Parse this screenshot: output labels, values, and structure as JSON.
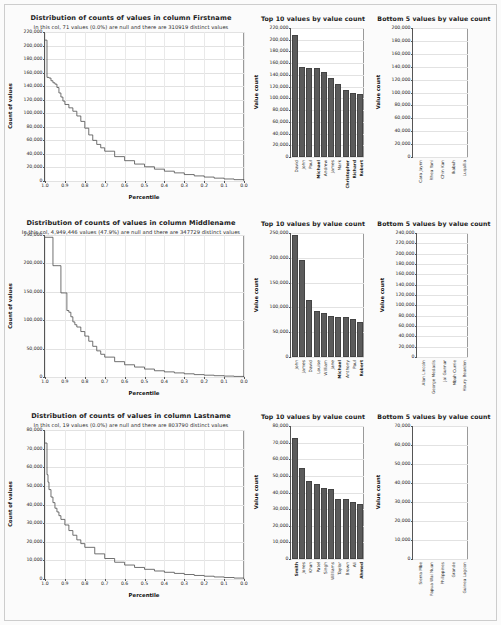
{
  "page": {
    "background_color": "#fbfbfb",
    "bar_color": "#5b5b5b",
    "curve_color": "#4d4d4d"
  },
  "chart_data": [
    {
      "id": "firstname-histogram",
      "type": "line",
      "title": "Distribution of counts of values in column Firstname",
      "subtitle": "In this col, 71 values (0.0%) are null and there are 310919 distinct values",
      "xlabel": "Percentile",
      "ylabel": "Count of values",
      "xlim": [
        1.0,
        0.0
      ],
      "ylim": [
        0,
        220000
      ],
      "xticks": [
        "1.0",
        "0.9",
        "0.8",
        "0.7",
        "0.6",
        "0.5",
        "0.4",
        "0.3",
        "0.2",
        "0.1",
        "0.0"
      ],
      "yticks": [
        "0",
        "20,000",
        "40,000",
        "60,000",
        "80,000",
        "100,000",
        "120,000",
        "140,000",
        "160,000",
        "180,000",
        "200,000",
        "220,000"
      ],
      "grid": true,
      "x": [
        1.0,
        0.995,
        0.99,
        0.98,
        0.97,
        0.96,
        0.95,
        0.94,
        0.93,
        0.92,
        0.91,
        0.9,
        0.88,
        0.86,
        0.84,
        0.82,
        0.8,
        0.78,
        0.76,
        0.74,
        0.72,
        0.7,
        0.65,
        0.6,
        0.55,
        0.5,
        0.45,
        0.4,
        0.35,
        0.3,
        0.25,
        0.2,
        0.15,
        0.1,
        0.05,
        0.0
      ],
      "y": [
        208000,
        208000,
        153000,
        152000,
        148000,
        145000,
        143000,
        138000,
        130000,
        124000,
        118000,
        113000,
        108000,
        103000,
        96000,
        88000,
        78000,
        68000,
        60000,
        54000,
        49000,
        44000,
        36000,
        30000,
        25000,
        21000,
        17500,
        14500,
        12000,
        9500,
        7500,
        5800,
        4200,
        3000,
        2000,
        1200
      ]
    },
    {
      "id": "firstname-top10",
      "type": "bar",
      "title": "Top 10 values by value count",
      "ylabel": "Value count",
      "xlabel": "",
      "ylim": [
        0,
        220000
      ],
      "yticks": [
        "0",
        "20,000",
        "40,000",
        "60,000",
        "80,000",
        "100,000",
        "120,000",
        "140,000",
        "160,000",
        "180,000",
        "200,000",
        "220,000"
      ],
      "categories": [
        "David",
        "John",
        "Paul",
        "Michael",
        "Andrew",
        "James",
        "Mark",
        "Christopher",
        "Richard",
        "Robert"
      ],
      "bold_categories": [
        "Michael",
        "Christopher",
        "Richard",
        "Robert"
      ],
      "values": [
        208000,
        153000,
        152000,
        151000,
        145000,
        134000,
        124000,
        114000,
        110000,
        107000
      ]
    },
    {
      "id": "firstname-bottom5",
      "type": "bar",
      "title": "Bottom 5 values by value count",
      "ylabel": "Value count",
      "xlabel": "",
      "ylim": [
        0,
        200000
      ],
      "yticks": [
        "0",
        "20,000",
        "40,000",
        "60,000",
        "80,000",
        "100,000",
        "120,000",
        "140,000",
        "160,000",
        "180,000",
        "200,000"
      ],
      "categories": [
        "Cara Jaynn",
        "Rhea Yani",
        "Chin Kan",
        "Ikabuh",
        "Luqallia"
      ],
      "values": [
        1,
        1,
        1,
        1,
        1
      ]
    },
    {
      "id": "middlename-histogram",
      "type": "line",
      "title": "Distribution of counts of values in column Middlename",
      "subtitle": "In this col, 4,949,446 values (47.9%) are null and there are 347729 distinct values",
      "xlabel": "Percentile",
      "ylabel": "Count of values",
      "xlim": [
        1.0,
        0.0
      ],
      "ylim": [
        0,
        250000
      ],
      "xticks": [
        "1.0",
        "0.9",
        "0.8",
        "0.7",
        "0.6",
        "0.5",
        "0.4",
        "0.3",
        "0.2",
        "0.1",
        "0.0"
      ],
      "yticks": [
        "0",
        "50,000",
        "100,000",
        "150,000",
        "200,000",
        "250,000"
      ],
      "grid": true,
      "x": [
        1.0,
        0.97,
        0.96,
        0.93,
        0.92,
        0.9,
        0.89,
        0.88,
        0.87,
        0.86,
        0.85,
        0.84,
        0.82,
        0.8,
        0.78,
        0.76,
        0.74,
        0.72,
        0.7,
        0.65,
        0.6,
        0.55,
        0.5,
        0.45,
        0.4,
        0.35,
        0.3,
        0.25,
        0.2,
        0.15,
        0.1,
        0.05,
        0.0
      ],
      "y": [
        246000,
        246000,
        196000,
        196000,
        148000,
        148000,
        117000,
        114000,
        106000,
        97000,
        92000,
        88000,
        80000,
        72000,
        63000,
        54000,
        46000,
        40000,
        35000,
        27000,
        21500,
        17500,
        14000,
        11000,
        9000,
        7200,
        5600,
        4200,
        3200,
        2300,
        1600,
        1000,
        600
      ]
    },
    {
      "id": "middlename-top10",
      "type": "bar",
      "title": "Top 10 values by value count",
      "ylabel": "Value count",
      "xlabel": "",
      "ylim": [
        0,
        250000
      ],
      "yticks": [
        "0",
        "50,000",
        "100,000",
        "150,000",
        "200,000",
        "250,000"
      ],
      "categories": [
        "John",
        "James",
        "David",
        "Louise",
        "William",
        "Jane",
        "Michael",
        "Anthony",
        "Paul",
        "Robert"
      ],
      "bold_categories": [
        "Michael",
        "Robert"
      ],
      "values": [
        246000,
        196000,
        114000,
        93000,
        88000,
        82000,
        81000,
        80000,
        76000,
        70000
      ]
    },
    {
      "id": "middlename-bottom5",
      "type": "bar",
      "title": "Bottom 5 values by value count",
      "ylabel": "Value count",
      "xlabel": "",
      "ylim": [
        0,
        240000
      ],
      "yticks": [
        "0",
        "20,000",
        "40,000",
        "60,000",
        "80,000",
        "100,000",
        "120,000",
        "140,000",
        "160,000",
        "180,000",
        "200,000",
        "220,000",
        "240,000"
      ],
      "categories": [
        "Alan Lincoln",
        "George Medadis",
        "Jai Gunnar",
        "Mbah Currie",
        "Houry Bearden"
      ],
      "bold_categories": [
        "Mbah Currie",
        "Houry Bearden"
      ],
      "values": [
        1,
        1,
        1,
        1,
        1
      ]
    },
    {
      "id": "lastname-histogram",
      "type": "line",
      "title": "Distribution of counts of values in column Lastname",
      "subtitle": "In this col, 19 values (0.0%) are null and there are 803790 distinct values",
      "xlabel": "Percentile",
      "ylabel": "Count of values",
      "xlim": [
        1.0,
        0.0
      ],
      "ylim": [
        0,
        80000
      ],
      "xticks": [
        "1.0",
        "0.9",
        "0.8",
        "0.7",
        "0.6",
        "0.5",
        "0.4",
        "0.3",
        "0.2",
        "0.1",
        "0.0"
      ],
      "yticks": [
        "0",
        "10,000",
        "20,000",
        "30,000",
        "40,000",
        "50,000",
        "60,000",
        "70,000",
        "80,000"
      ],
      "grid": true,
      "x": [
        1.0,
        0.995,
        0.99,
        0.985,
        0.98,
        0.97,
        0.96,
        0.95,
        0.94,
        0.93,
        0.92,
        0.9,
        0.88,
        0.86,
        0.84,
        0.82,
        0.8,
        0.75,
        0.7,
        0.65,
        0.6,
        0.55,
        0.5,
        0.45,
        0.4,
        0.35,
        0.3,
        0.25,
        0.2,
        0.15,
        0.1,
        0.05,
        0.0
      ],
      "y": [
        73000,
        73000,
        56000,
        52000,
        48000,
        44000,
        41000,
        38000,
        36000,
        34000,
        32000,
        29000,
        26000,
        23500,
        21000,
        19000,
        17000,
        13500,
        11000,
        9000,
        7500,
        6200,
        5200,
        4300,
        3600,
        3000,
        2400,
        1900,
        1500,
        1100,
        800,
        500,
        300
      ]
    },
    {
      "id": "lastname-top10",
      "type": "bar",
      "title": "Top 10 values by value count",
      "ylabel": "Value count",
      "xlabel": "",
      "ylim": [
        0,
        80000
      ],
      "yticks": [
        "0",
        "10,000",
        "20,000",
        "30,000",
        "40,000",
        "50,000",
        "60,000",
        "70,000",
        "80,000"
      ],
      "categories": [
        "Smith",
        "Jones",
        "Khan",
        "Patel",
        "Singh",
        "Williams",
        "Taylor",
        "Brown",
        "Ali",
        "Ahmed"
      ],
      "bold_categories": [
        "Smith",
        "Ahmed"
      ],
      "values": [
        73000,
        55000,
        47000,
        45000,
        43000,
        42000,
        36000,
        36000,
        34000,
        33000
      ]
    },
    {
      "id": "lastname-bottom5",
      "type": "bar",
      "title": "Bottom 5 values by value count",
      "ylabel": "Value count",
      "xlabel": "",
      "ylim": [
        0,
        70000
      ],
      "yticks": [
        "0",
        "10,000",
        "20,000",
        "30,000",
        "40,000",
        "50,000",
        "60,000",
        "70,000"
      ],
      "categories": [
        "Sierra Mbe",
        "Papua Wai Nuan",
        "Philippines",
        "Grande",
        "Guinea Lagoon"
      ],
      "values": [
        1,
        1,
        1,
        1,
        1
      ]
    }
  ]
}
